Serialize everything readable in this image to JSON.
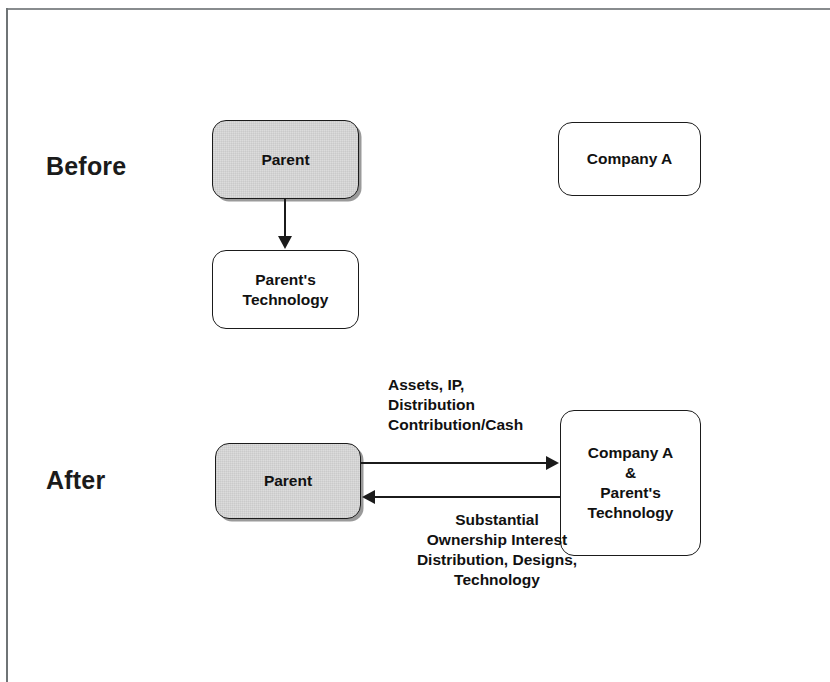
{
  "diagram": {
    "sections": {
      "before": {
        "label": "Before"
      },
      "after": {
        "label": "After"
      }
    },
    "nodes": {
      "before_parent": {
        "label": "Parent",
        "fill": "#dcdcdc",
        "shaded": true
      },
      "before_company_a": {
        "label": "Company A",
        "fill": "#ffffff",
        "shaded": false
      },
      "before_parent_technology": {
        "label": "Parent's\nTechnology",
        "fill": "#ffffff",
        "shaded": false
      },
      "after_parent": {
        "label": "Parent",
        "fill": "#dcdcdc",
        "shaded": true
      },
      "after_company_combined": {
        "label": "Company A\n&\nParent's\nTechnology",
        "fill": "#ffffff",
        "shaded": false
      }
    },
    "edges": {
      "before_parent_to_technology": {
        "label": "",
        "direction": "down"
      },
      "after_parent_to_company": {
        "label": "Assets, IP,\nDistribution\nContribution/Cash",
        "direction": "right"
      },
      "after_company_to_parent": {
        "label": "Substantial\nOwnership Interest\nDistribution, Designs,\nTechnology",
        "direction": "left"
      }
    },
    "colors": {
      "stroke": "#1b1b1b",
      "text": "#111111",
      "shaded_fill": "#dcdcdc",
      "plain_fill": "#ffffff",
      "frame": "#888c8e",
      "shadow": "#9a9a9a"
    }
  }
}
